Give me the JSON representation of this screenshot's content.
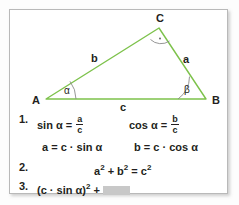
{
  "figure": {
    "name": "right-triangle-trigonometry",
    "geometry": {
      "vertices": {
        "A": {
          "x": 36,
          "y": 89,
          "label": "A"
        },
        "B": {
          "x": 196,
          "y": 89,
          "label": "B"
        },
        "C": {
          "x": 149,
          "y": 18,
          "label": "C"
        }
      },
      "sides": [
        {
          "label": "a",
          "from": "C",
          "to": "B"
        },
        {
          "label": "b",
          "from": "A",
          "to": "C"
        },
        {
          "label": "c",
          "from": "A",
          "to": "B"
        }
      ],
      "angles": [
        {
          "label": "α",
          "at": "A"
        },
        {
          "label": "β",
          "at": "B"
        },
        {
          "label": "right-angle",
          "at": "C",
          "marker": "arc-with-dot"
        }
      ]
    },
    "colors": {
      "triangle_stroke": "#7dc24b",
      "angle_arc": "#7f7f7f",
      "text": "#231f20",
      "frame_border": "#b9b9b9",
      "blank_fill": "#c8c8c8",
      "background": "#ffffff"
    },
    "labels": {
      "vertex_a": "A",
      "vertex_b": "B",
      "vertex_c": "C",
      "side_a": "a",
      "side_b": "b",
      "side_c": "c",
      "angle_alpha": "α",
      "angle_beta": "β"
    }
  },
  "equations": {
    "line1": {
      "number": "1.",
      "left": {
        "lhs": "sin α",
        "eq": "=",
        "num": "a",
        "den": "c"
      },
      "right": {
        "lhs": "cos α",
        "eq": "=",
        "num": "b",
        "den": "c"
      }
    },
    "line1b": {
      "left": "a = c · sin α",
      "right": "b = c · cos α"
    },
    "line2": {
      "number": "2.",
      "text_pre": "a",
      "sup1": "2",
      "text_mid": " + b",
      "sup2": "2",
      "text_eq": " = c",
      "sup3": "2"
    },
    "line3": {
      "number": "3.",
      "text_pre": "(c · sin α)",
      "sup": "2",
      "text_post": " + ",
      "blank": ""
    }
  }
}
